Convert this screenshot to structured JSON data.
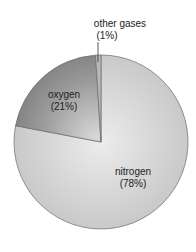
{
  "chart_data": {
    "type": "pie",
    "title": "",
    "categories": [
      "nitrogen",
      "oxygen",
      "other gases"
    ],
    "values": [
      78,
      21,
      1
    ],
    "labels": [
      {
        "name": "nitrogen",
        "pct": "(78%)"
      },
      {
        "name": "oxygen",
        "pct": "(21%)"
      },
      {
        "name": "other gases",
        "pct": "(1%)"
      }
    ],
    "colors": [
      "#d4d4d4",
      "#8e8e8e",
      "#b8b8b8"
    ],
    "start_angle": "12 o'clock",
    "direction": "clockwise",
    "legend": "none (inline labels)"
  },
  "labels": {
    "nitrogen_name": "nitrogen",
    "nitrogen_pct": "(78%)",
    "oxygen_name": "oxygen",
    "oxygen_pct": "(21%)",
    "other_name": "other gases",
    "other_pct": "(1%)"
  }
}
